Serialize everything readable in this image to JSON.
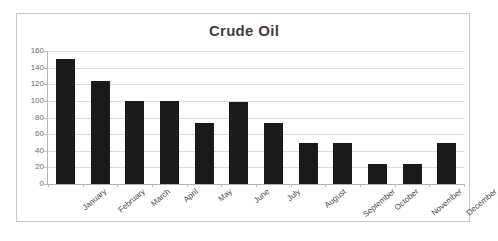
{
  "chart_data": {
    "type": "bar",
    "title": "Crude Oil",
    "xlabel": "",
    "ylabel": "",
    "ylim": [
      0,
      160
    ],
    "ytick_step": 20,
    "grid": true,
    "legend": false,
    "bar_color": "#1a1a1a",
    "categories": [
      "January",
      "February",
      "March",
      "April",
      "May",
      "June",
      "July",
      "August",
      "September",
      "October",
      "November",
      "December"
    ],
    "values": [
      150,
      124,
      100,
      100,
      74,
      99,
      74,
      49,
      49,
      24,
      24,
      49
    ],
    "yticks": [
      0,
      20,
      40,
      60,
      80,
      100,
      120,
      140,
      160
    ]
  },
  "style": {
    "title_color": "#404040",
    "gridline_color": "#d9d9d9",
    "axis_color": "#b5b5b5",
    "tick_label_color": "#6b6b6b",
    "category_label_color": "#4a4a4a",
    "frame_color": "#c9c9c9",
    "background": "#ffffff"
  }
}
